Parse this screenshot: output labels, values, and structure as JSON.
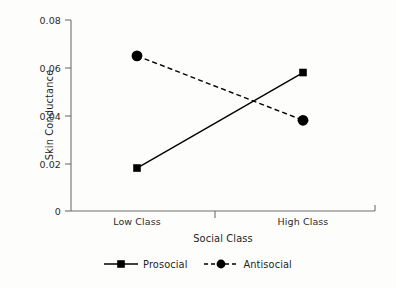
{
  "chart_data": {
    "type": "line",
    "title": "",
    "xlabel": "Social Class",
    "ylabel": "Skin Conductance",
    "categories": [
      "Low Class",
      "High Class"
    ],
    "series": [
      {
        "name": "Prosocial",
        "values": [
          0.018,
          0.058
        ],
        "marker": "square",
        "linestyle": "solid",
        "color": "#000000"
      },
      {
        "name": "Antisocial",
        "values": [
          0.065,
          0.038
        ],
        "marker": "circle",
        "linestyle": "dashed",
        "color": "#000000"
      }
    ],
    "ylim": [
      0,
      0.08
    ],
    "yticks": [
      "0",
      "0.02",
      "0.04",
      "0.06",
      "0.08"
    ],
    "ytick_values": [
      0,
      0.02,
      0.04,
      0.06,
      0.08
    ],
    "xtick_labels": [
      "Low Class",
      "High Class"
    ],
    "grid": false,
    "legend_position": "bottom-center",
    "axis_color": "#6f6f6f",
    "background_color": "#fdfdfc"
  },
  "axes": {
    "y_label": "Skin Conductance",
    "x_label": "Social Class",
    "y_ticks": [
      {
        "label": "0.08"
      },
      {
        "label": "0.06"
      },
      {
        "label": "0.04"
      },
      {
        "label": "0.02"
      },
      {
        "label": "0"
      }
    ],
    "x_ticks": [
      {
        "label": "Low Class"
      },
      {
        "label": "High Class"
      }
    ]
  },
  "legend": {
    "items": [
      {
        "label": "Prosocial"
      },
      {
        "label": "Antisocial"
      }
    ]
  }
}
